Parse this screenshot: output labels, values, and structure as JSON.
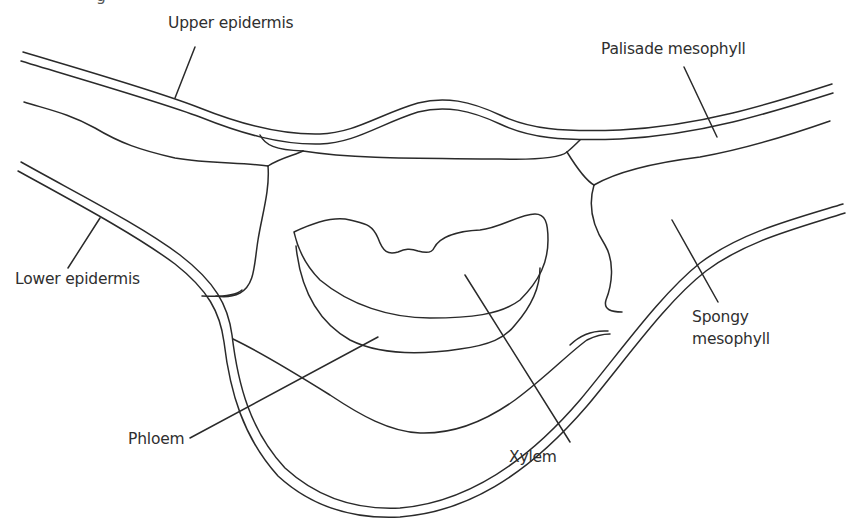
{
  "diagram": {
    "clipped_text": "g",
    "line_color": "#2a2a2a",
    "background": "#ffffff",
    "labels": {
      "upper_epidermis": "Upper epidermis",
      "palisade_mesophyll": "Palisade mesophyll",
      "lower_epidermis": "Lower epidermis",
      "spongy_mesophyll_line1": "Spongy",
      "spongy_mesophyll_line2": "mesophyll",
      "phloem": "Phloem",
      "xylem": "Xylem"
    }
  }
}
